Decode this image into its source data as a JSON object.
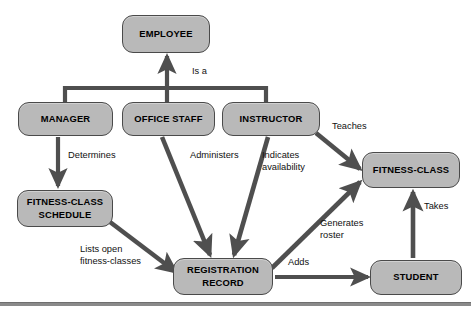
{
  "diagram": {
    "type": "class-diagram",
    "nodes": [
      {
        "id": "employee",
        "label": "EMPLOYEE",
        "x": 122,
        "y": 15,
        "w": 88,
        "h": 38
      },
      {
        "id": "manager",
        "label": "MANAGER",
        "x": 18,
        "y": 102,
        "w": 95,
        "h": 34
      },
      {
        "id": "office-staff",
        "label": "OFFICE STAFF",
        "x": 122,
        "y": 102,
        "w": 93,
        "h": 34
      },
      {
        "id": "instructor",
        "label": "INSTRUCTOR",
        "x": 222,
        "y": 102,
        "w": 98,
        "h": 34
      },
      {
        "id": "fitness-class-schedule",
        "label": "FITNESS-CLASS\nSCHEDULE",
        "x": 17,
        "y": 190,
        "w": 96,
        "h": 37
      },
      {
        "id": "registration-record",
        "label": "REGISTRATION\nRECORD",
        "x": 173,
        "y": 258,
        "w": 100,
        "h": 37
      },
      {
        "id": "fitness-class",
        "label": "FITNESS-CLASS",
        "x": 362,
        "y": 152,
        "w": 98,
        "h": 36
      },
      {
        "id": "student",
        "label": "STUDENT",
        "x": 370,
        "y": 260,
        "w": 92,
        "h": 35
      }
    ],
    "edges": [
      {
        "id": "is-a",
        "label": "Is a",
        "from": "manager, office-staff, instructor",
        "to": "employee",
        "label_x": 192,
        "label_y": 66
      },
      {
        "id": "determines",
        "label": "Determines",
        "from": "manager",
        "to": "fitness-class-schedule",
        "label_x": 68,
        "label_y": 150
      },
      {
        "id": "administers",
        "label": "Administers",
        "from": "office-staff",
        "to": "registration-record",
        "label_x": 190,
        "label_y": 150
      },
      {
        "id": "indicates-availability",
        "label": "Indicates\navailability",
        "from": "instructor",
        "to": "registration-record",
        "label_x": 262,
        "label_y": 150
      },
      {
        "id": "teaches",
        "label": "Teaches",
        "from": "instructor",
        "to": "fitness-class",
        "label_x": 332,
        "label_y": 121
      },
      {
        "id": "lists-open-fitness-classes",
        "label": "Lists open\nfitness-classes",
        "from": "fitness-class-schedule",
        "to": "registration-record",
        "label_x": 80,
        "label_y": 244
      },
      {
        "id": "generates-roster",
        "label": "Generates\nroster",
        "from": "registration-record",
        "to": "fitness-class",
        "label_x": 320,
        "label_y": 218
      },
      {
        "id": "adds",
        "label": "Adds",
        "from": "registration-record",
        "to": "student",
        "label_x": 288,
        "label_y": 257
      },
      {
        "id": "takes",
        "label": "Takes",
        "from": "student",
        "to": "fitness-class",
        "label_x": 424,
        "label_y": 201
      }
    ],
    "colors": {
      "node_fill": "#b9b9b9",
      "node_border": "#4a4a4a",
      "edge_stroke": "#4f4f4f",
      "text": "#000000",
      "background": "#ffffff",
      "footer_rule": "#8a8a8a"
    },
    "footer_rule": {
      "y": 302
    }
  }
}
